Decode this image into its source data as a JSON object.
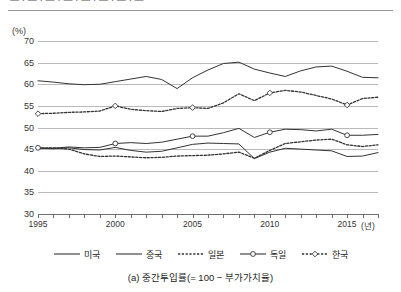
{
  "header": {
    "cut_text": "— · — · — · — · — · — · — · —"
  },
  "chart_data": {
    "type": "line",
    "title": "",
    "caption": "(a) 중간투입률(= 100 − 부가가치율)",
    "unit_label": "(%)",
    "xlabel": "(년)",
    "ylabel": "",
    "grid": true,
    "legend_position": "bottom",
    "xlim": [
      1995,
      2017
    ],
    "ylim": [
      30,
      70
    ],
    "ytick_values": [
      70,
      65,
      60,
      55,
      50,
      45,
      40,
      35,
      30
    ],
    "xtick_values": [
      1995,
      1996,
      1997,
      1998,
      1999,
      2000,
      2001,
      2002,
      2003,
      2004,
      2005,
      2006,
      2007,
      2008,
      2009,
      2010,
      2011,
      2012,
      2013,
      2014,
      2015,
      2016,
      2017
    ],
    "xtick_labels": [
      {
        "value": 1995,
        "label": "1995"
      },
      {
        "value": 2000,
        "label": "2000"
      },
      {
        "value": 2005,
        "label": "2005"
      },
      {
        "value": 2010,
        "label": "2010"
      },
      {
        "value": 2015,
        "label": "2015"
      }
    ],
    "x": [
      1995,
      1996,
      1997,
      1998,
      1999,
      2000,
      2001,
      2002,
      2003,
      2004,
      2005,
      2006,
      2007,
      2008,
      2009,
      2010,
      2011,
      2012,
      2013,
      2014,
      2015,
      2016,
      2017
    ],
    "series": [
      {
        "name": "미국",
        "label": "미국",
        "color": "#333333",
        "style": "solid",
        "marker": "none",
        "values": [
          45.2,
          45.1,
          45.3,
          44.9,
          44.8,
          45.4,
          44.7,
          44.3,
          44.5,
          45.3,
          46.1,
          46.4,
          46.3,
          46.2,
          42.8,
          44.3,
          45.2,
          45.0,
          44.8,
          44.6,
          43.3,
          43.4,
          44.2
        ]
      },
      {
        "name": "중국",
        "label": "중국",
        "color": "#333333",
        "style": "solid",
        "marker": "none",
        "values": [
          60.8,
          60.5,
          60.1,
          59.9,
          60.0,
          60.6,
          61.2,
          61.8,
          61.1,
          59.0,
          61.5,
          63.3,
          64.8,
          65.1,
          63.5,
          62.6,
          61.8,
          63.1,
          64.0,
          64.2,
          63.0,
          61.6,
          61.5
        ]
      },
      {
        "name": "일본",
        "label": "일본",
        "color": "#333333",
        "style": "dotted",
        "marker": "none",
        "values": [
          45.2,
          45.3,
          45.0,
          43.9,
          43.3,
          43.4,
          43.2,
          43.0,
          43.1,
          43.4,
          43.5,
          43.6,
          43.9,
          44.3,
          42.9,
          44.7,
          46.3,
          46.7,
          47.1,
          47.3,
          46.0,
          45.6,
          46.0
        ]
      },
      {
        "name": "독일",
        "label": "독일",
        "color": "#333333",
        "style": "solid",
        "marker": "circle",
        "values": [
          45.3,
          45.2,
          45.5,
          45.3,
          45.4,
          46.3,
          46.5,
          46.3,
          46.6,
          47.3,
          48.0,
          48.0,
          48.8,
          49.8,
          47.7,
          48.9,
          49.6,
          49.5,
          49.2,
          49.6,
          48.2,
          48.2,
          48.4
        ]
      },
      {
        "name": "한국",
        "label": "한국",
        "color": "#333333",
        "style": "dotted",
        "marker": "diamond",
        "values": [
          53.2,
          53.3,
          53.5,
          53.6,
          53.8,
          55.0,
          54.2,
          53.9,
          53.7,
          54.4,
          54.6,
          54.4,
          55.7,
          57.8,
          56.2,
          58.0,
          58.6,
          58.2,
          57.4,
          56.6,
          55.2,
          56.7,
          57.0
        ]
      }
    ]
  }
}
